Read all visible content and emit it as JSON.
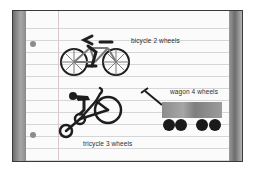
{
  "colors": {
    "ink": "#1e1e1e",
    "wagon_body": "#8a8a8a",
    "wheel_fill": "#1a1a1a",
    "spoke_gray": "#7a7a7a",
    "paper": "#fbfbfb",
    "rule_line": "#d6d6d6",
    "edge_gray": "#8c8c8c"
  },
  "items": [
    {
      "id": "bicycle",
      "label": "bicycle 2 wheels",
      "wheels": 2
    },
    {
      "id": "wagon",
      "label": "wagon 4 wheels",
      "wheels": 4
    },
    {
      "id": "tricycle",
      "label": "tricycle 3 wheels",
      "wheels": 3
    }
  ]
}
